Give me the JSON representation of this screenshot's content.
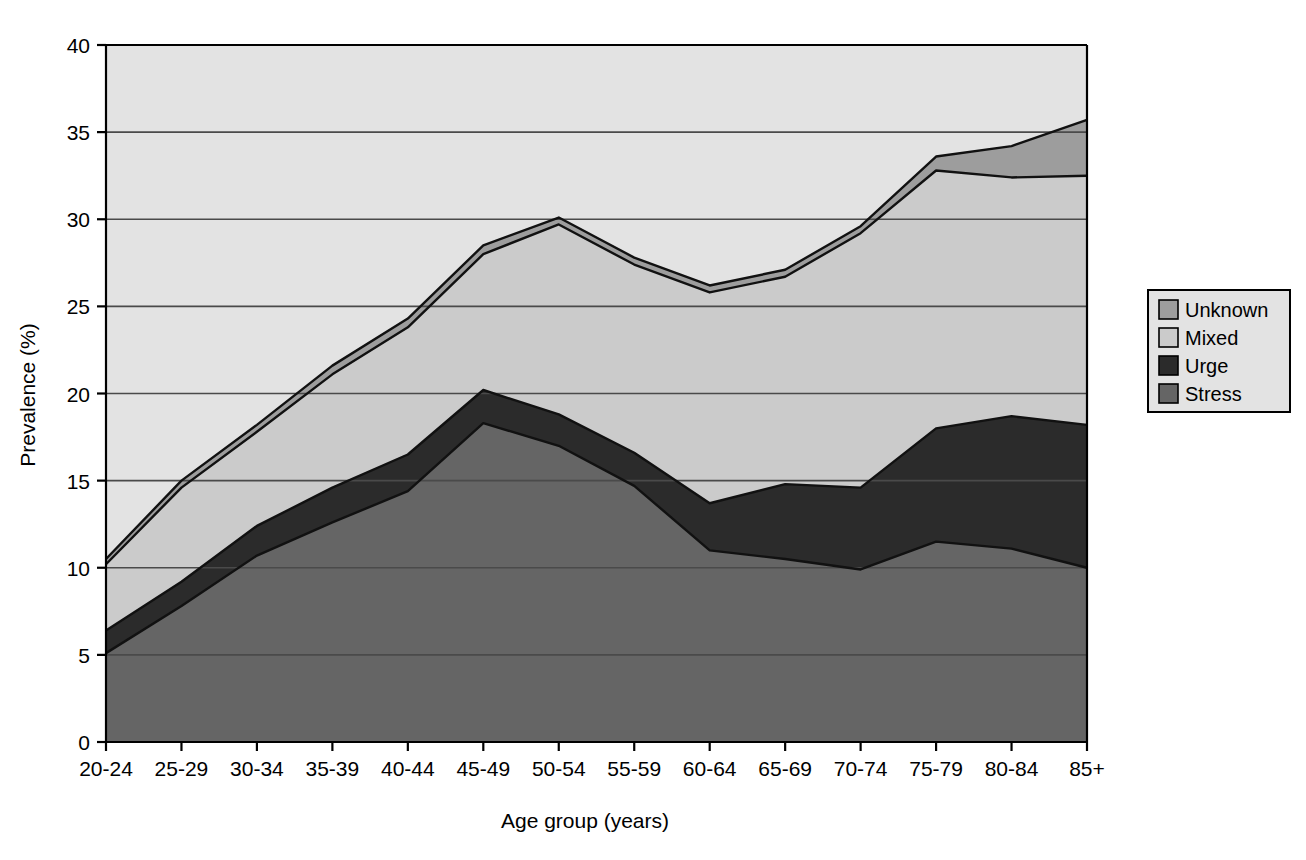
{
  "chart_data": {
    "type": "area",
    "stacked": true,
    "title": "",
    "xlabel": "Age group (years)",
    "ylabel": "Prevalence (%)",
    "categories": [
      "20-24",
      "25-29",
      "30-34",
      "35-39",
      "40-44",
      "45-49",
      "50-54",
      "55-59",
      "60-64",
      "65-69",
      "70-74",
      "75-79",
      "80-84",
      "85+"
    ],
    "xtick_labels": [
      "20-24",
      "25-29",
      "30-34",
      "35-39",
      "40-44",
      "45-49",
      "50-54",
      "55-59",
      "60-64",
      "65-69",
      "70-74",
      "75-79",
      "80-84",
      "85+"
    ],
    "ytick_labels": [
      "0",
      "5",
      "10",
      "15",
      "20",
      "25",
      "30",
      "35",
      "40"
    ],
    "yticks": [
      0,
      5,
      10,
      15,
      20,
      25,
      30,
      35,
      40
    ],
    "ylim": [
      0,
      40
    ],
    "grid": "horizontal",
    "legend_position": "right",
    "legend_entries": [
      "Unknown",
      "Mixed",
      "Urge",
      "Stress"
    ],
    "series": [
      {
        "name": "Stress",
        "color": "#656565",
        "values": [
          5.1,
          7.8,
          10.7,
          12.6,
          14.4,
          18.3,
          17.0,
          14.7,
          11.0,
          10.5,
          9.9,
          11.5,
          11.1,
          10.0
        ]
      },
      {
        "name": "Urge",
        "color": "#2b2b2b",
        "values": [
          1.3,
          1.4,
          1.7,
          2.0,
          2.1,
          1.9,
          1.8,
          1.9,
          2.7,
          4.3,
          4.7,
          6.5,
          7.6,
          8.2
        ]
      },
      {
        "name": "Mixed",
        "color": "#cbcbcb",
        "values": [
          3.8,
          5.4,
          5.4,
          6.5,
          7.3,
          7.8,
          10.9,
          10.8,
          12.1,
          11.9,
          14.6,
          14.8,
          13.7,
          14.3
        ]
      },
      {
        "name": "Unknown",
        "color": "#9d9d9d",
        "values": [
          0.3,
          0.4,
          0.4,
          0.5,
          0.5,
          0.5,
          0.4,
          0.4,
          0.4,
          0.4,
          0.4,
          0.8,
          1.8,
          3.2
        ]
      }
    ],
    "cumulative": {
      "stress": [
        5.1,
        7.8,
        10.7,
        12.6,
        14.4,
        18.3,
        17.0,
        14.7,
        11.0,
        10.5,
        9.9,
        11.5,
        11.1,
        10.0
      ],
      "urge": [
        6.4,
        9.2,
        12.4,
        14.6,
        16.5,
        20.2,
        18.8,
        16.6,
        13.7,
        14.8,
        14.6,
        18.0,
        18.7,
        18.2
      ],
      "mixed": [
        10.2,
        14.6,
        17.8,
        21.1,
        23.8,
        28.0,
        29.7,
        27.4,
        25.8,
        26.7,
        29.2,
        32.8,
        32.4,
        32.5
      ],
      "unknown": [
        10.5,
        15.0,
        18.2,
        21.6,
        24.3,
        28.5,
        30.1,
        27.8,
        26.2,
        27.1,
        29.6,
        33.6,
        34.2,
        35.7
      ]
    }
  },
  "axes": {
    "ylabel": "Prevalence (%)",
    "xlabel": "Age group (years)"
  },
  "legend": {
    "items": [
      {
        "label": "Unknown",
        "swatch": "#9d9d9d"
      },
      {
        "label": "Mixed",
        "swatch": "#cbcbcb"
      },
      {
        "label": "Urge",
        "swatch": "#2b2b2b"
      },
      {
        "label": "Stress",
        "swatch": "#656565"
      }
    ]
  },
  "colors": {
    "stress": "#656565",
    "urge": "#2b2b2b",
    "mixed": "#cbcbcb",
    "unknown": "#9d9d9d",
    "axis": "#000000",
    "gridline": "#4a4a4a",
    "background": "#ffffff"
  }
}
